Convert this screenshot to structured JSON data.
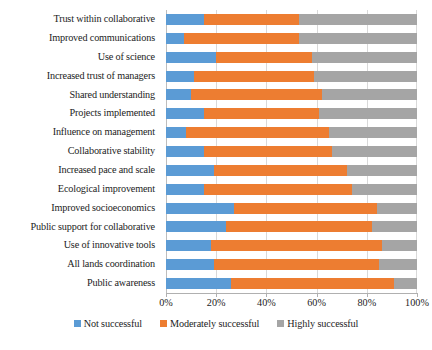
{
  "chart_data": {
    "type": "bar",
    "orientation": "horizontal",
    "stacked": true,
    "stack_mode": "percent",
    "title": "",
    "xlabel": "",
    "ylabel": "",
    "xlim": [
      0,
      100
    ],
    "xticks": [
      0,
      20,
      40,
      60,
      80,
      100
    ],
    "xtick_labels": [
      "0%",
      "20%",
      "40%",
      "60%",
      "80%",
      "100%"
    ],
    "grid": true,
    "grid_axis": "x",
    "legend_position": "bottom",
    "categories": [
      "Trust within collaborative",
      "Improved communications",
      "Use of science",
      "Increased trust of managers",
      "Shared understanding",
      "Projects implemented",
      "Influence on management",
      "Collaborative stability",
      "Increased pace and scale",
      "Ecological improvement",
      "Improved socioeconomics",
      "Public support for collaborative",
      "Use of innovative tools",
      "All lands coordination",
      "Public awareness"
    ],
    "series": [
      {
        "name": "Not successful",
        "color": "#5b9bd5",
        "values": [
          15,
          7,
          20,
          11,
          10,
          15,
          8,
          15,
          19,
          15,
          27,
          24,
          18,
          19,
          26
        ]
      },
      {
        "name": "Moderately successful",
        "color": "#ed7d31",
        "values": [
          38,
          46,
          38,
          48,
          52,
          46,
          57,
          51,
          53,
          59,
          57,
          58,
          68,
          66,
          65
        ]
      },
      {
        "name": "Highly successful",
        "color": "#a5a5a5",
        "values": [
          47,
          47,
          42,
          41,
          38,
          39,
          35,
          34,
          28,
          26,
          16,
          18,
          14,
          15,
          9
        ]
      }
    ]
  }
}
